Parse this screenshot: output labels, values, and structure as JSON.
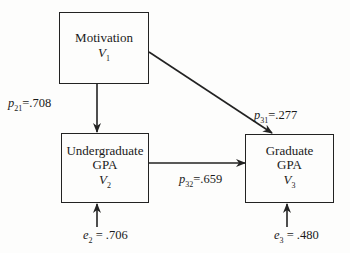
{
  "diagram": {
    "type": "path-diagram",
    "nodes": [
      {
        "id": "V1",
        "name_lines": [
          "Motivation"
        ],
        "var": "V",
        "sub": "1"
      },
      {
        "id": "V2",
        "name_lines": [
          "Undergraduate",
          "GPA"
        ],
        "var": "V",
        "sub": "2"
      },
      {
        "id": "V3",
        "name_lines": [
          "Graduate",
          "GPA"
        ],
        "var": "V",
        "sub": "3"
      }
    ],
    "edges": [
      {
        "from": "V1",
        "to": "V2",
        "coef_sym": "p",
        "coef_sub": "21",
        "value": "=.708"
      },
      {
        "from": "V1",
        "to": "V3",
        "coef_sym": "p",
        "coef_sub": "31",
        "value": "=.277"
      },
      {
        "from": "V2",
        "to": "V3",
        "coef_sym": "p",
        "coef_sub": "32",
        "value": "=.659"
      }
    ],
    "errors": [
      {
        "to": "V2",
        "sym": "e",
        "sub": "2",
        "value": "= .706"
      },
      {
        "to": "V3",
        "sym": "e",
        "sub": "3",
        "value": "= .480"
      }
    ]
  }
}
